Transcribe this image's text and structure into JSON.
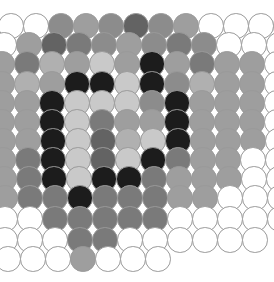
{
  "image": {
    "kind": "micrograph",
    "subject": "two-dimensional hexagonal close-packed colloidal particle monolayer",
    "width": 274,
    "height": 282,
    "background_color": "#ffffff",
    "outline_color": "#9a9a9a"
  },
  "lattice": {
    "type": "hexagonal-close-packed-2d",
    "disc_diameter": 25.5,
    "row_pitch": 21.6,
    "column_pitch": 25.0,
    "row_offset": 12.5,
    "origin_x": 11.0,
    "origin_y": 15.0,
    "row_count": 12,
    "note": "alternating rows are shifted by half a column pitch"
  },
  "palette": {
    "empty": "#ffffff",
    "very_light": "#c9c9c9",
    "light": "#b0b0b0",
    "mid_light": "#9e9e9e",
    "mid": "#8c8c8c",
    "mid_dark": "#7a7a7a",
    "dark": "#636363",
    "very_dark": "#4a4a4a",
    "black": "#1c1c1c"
  },
  "chart_data": {
    "type": "heatmap",
    "title": "",
    "xlabel": "",
    "ylabel": "",
    "legend": [
      "empty",
      "very_light",
      "light",
      "mid_light",
      "mid",
      "mid_dark",
      "dark",
      "very_dark",
      "black"
    ],
    "rows": [
      {
        "index": 0,
        "y": 26.0,
        "x_start": 11.0,
        "shift": 0,
        "cells": [
          "empty",
          "empty",
          "mid",
          "mid_light",
          "mid",
          "dark",
          "mid",
          "mid_light",
          "empty",
          "empty",
          "empty",
          "empty"
        ]
      },
      {
        "index": 1,
        "y": 45.0,
        "x_start": 4.0,
        "shift": 1,
        "cells": [
          "empty",
          "mid_light",
          "dark",
          "mid_dark",
          "mid",
          "mid_light",
          "mid",
          "mid_dark",
          "mid",
          "empty",
          "empty",
          "empty"
        ]
      },
      {
        "index": 2,
        "y": 64.0,
        "x_start": 2.0,
        "shift": 0,
        "cells": [
          "mid_light",
          "mid_dark",
          "light",
          "mid_light",
          "very_light",
          "mid_light",
          "black",
          "mid_light",
          "mid_dark",
          "mid_light",
          "mid_light",
          "empty"
        ]
      },
      {
        "index": 3,
        "y": 84.0,
        "x_start": 2.0,
        "shift": 1,
        "cells": [
          "mid_light",
          "light",
          "mid_light",
          "black",
          "black",
          "very_light",
          "black",
          "mid",
          "light",
          "mid_light",
          "mid_light",
          "empty"
        ]
      },
      {
        "index": 4,
        "y": 103.0,
        "x_start": 2.0,
        "shift": 0,
        "cells": [
          "mid_light",
          "mid_light",
          "black",
          "very_light",
          "very_light",
          "very_light",
          "mid",
          "black",
          "mid_light",
          "mid_light",
          "mid_light",
          "empty"
        ]
      },
      {
        "index": 5,
        "y": 122.0,
        "x_start": 2.0,
        "shift": 1,
        "cells": [
          "mid_light",
          "mid_light",
          "black",
          "very_light",
          "mid_dark",
          "mid_light",
          "mid_light",
          "black",
          "mid_light",
          "mid_light",
          "mid_light",
          "empty"
        ]
      },
      {
        "index": 6,
        "y": 141.0,
        "x_start": 3.0,
        "shift": 0,
        "cells": [
          "mid_light",
          "mid_light",
          "black",
          "very_light",
          "dark",
          "light",
          "very_light",
          "black",
          "mid_light",
          "mid_light",
          "mid_light",
          "empty"
        ]
      },
      {
        "index": 7,
        "y": 160.0,
        "x_start": 3.0,
        "shift": 1,
        "cells": [
          "mid_light",
          "mid_dark",
          "black",
          "very_light",
          "dark",
          "very_light",
          "black",
          "mid_dark",
          "mid_light",
          "mid_light",
          "empty",
          "empty"
        ]
      },
      {
        "index": 8,
        "y": 179.0,
        "x_start": 4.0,
        "shift": 0,
        "cells": [
          "mid_light",
          "mid_dark",
          "black",
          "very_light",
          "black",
          "black",
          "mid_dark",
          "mid_light",
          "mid_light",
          "mid_light",
          "empty",
          "empty"
        ]
      },
      {
        "index": 9,
        "y": 198.0,
        "x_start": 5.0,
        "shift": 1,
        "cells": [
          "mid_light",
          "mid_dark",
          "mid_dark",
          "black",
          "mid_dark",
          "mid_dark",
          "mid_dark",
          "mid_light",
          "mid_light",
          "empty",
          "empty",
          "empty"
        ]
      },
      {
        "index": 10,
        "y": 219.0,
        "x_start": 5.0,
        "shift": 0,
        "cells": [
          "empty",
          "empty",
          "mid_dark",
          "mid_dark",
          "mid_dark",
          "mid_dark",
          "mid_dark",
          "empty",
          "empty",
          "empty",
          "empty",
          "empty"
        ]
      },
      {
        "index": 11,
        "y": 240.0,
        "x_start": 5.0,
        "shift": 1,
        "cells": [
          "empty",
          "empty",
          "empty",
          "mid_dark",
          "mid_dark",
          "empty",
          "empty",
          "empty",
          "empty",
          "empty",
          "empty"
        ]
      },
      {
        "index": 12,
        "y": 259.0,
        "x_start": 8.0,
        "shift": 0,
        "cells": [
          "empty",
          "empty",
          "empty",
          "mid_light",
          "empty",
          "empty",
          "empty"
        ]
      }
    ]
  }
}
